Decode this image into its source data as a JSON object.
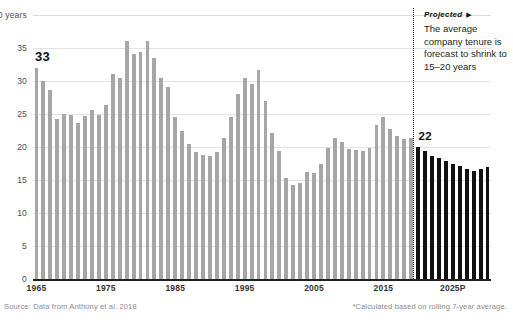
{
  "chart_data": {
    "type": "bar",
    "title": "",
    "xlabel": "",
    "ylabel": "years",
    "ylim": [
      0,
      40
    ],
    "ytick_values": [
      0,
      5,
      10,
      15,
      20,
      25,
      30,
      35,
      40
    ],
    "ytick_labels": [
      "0",
      "5",
      "10",
      "15",
      "20",
      "25",
      "30",
      "35",
      "40 years"
    ],
    "xtick_labels": [
      "1965",
      "1975",
      "1985",
      "1995",
      "2005",
      "2015",
      "2025P"
    ],
    "xtick_years": [
      1965,
      1975,
      1985,
      1995,
      2005,
      2015,
      2025
    ],
    "grid": true,
    "legend": "none",
    "x_start_year": 1965,
    "x_end_year": 2030,
    "projection_start_year": 2020,
    "bar_color": "#a6a6a6",
    "projected_bar_color": "#111111",
    "series": [
      {
        "name": "Average company tenure (historical)",
        "kind": "historical",
        "color": "#a6a6a6",
        "x": [
          1965,
          1966,
          1967,
          1968,
          1969,
          1970,
          1971,
          1972,
          1973,
          1974,
          1975,
          1976,
          1977,
          1978,
          1979,
          1980,
          1981,
          1982,
          1983,
          1984,
          1985,
          1986,
          1987,
          1988,
          1989,
          1990,
          1991,
          1992,
          1993,
          1994,
          1995,
          1996,
          1997,
          1998,
          1999,
          2000,
          2001,
          2002,
          2003,
          2004,
          2005,
          2006,
          2007,
          2008,
          2009,
          2010,
          2011,
          2012,
          2013,
          2014,
          2015,
          2016,
          2017,
          2018,
          2019
        ],
        "values": [
          32.0,
          30.0,
          28.6,
          24.2,
          25.0,
          24.8,
          23.7,
          24.7,
          25.6,
          24.9,
          26.4,
          31.0,
          30.5,
          36.0,
          34.1,
          34.4,
          36.0,
          33.5,
          30.5,
          29.1,
          24.5,
          22.4,
          20.5,
          19.3,
          18.8,
          18.7,
          19.3,
          21.4,
          24.6,
          28.0,
          30.5,
          29.6,
          31.6,
          26.9,
          22.1,
          19.4,
          15.3,
          14.2,
          14.6,
          16.2,
          16.0,
          17.5,
          19.9,
          21.4,
          20.8,
          19.7,
          19.5,
          19.4,
          19.9,
          23.4,
          24.6,
          22.7,
          21.6,
          21.2,
          21.3
        ]
      },
      {
        "name": "Average company tenure (projected)",
        "kind": "projected",
        "color": "#111111",
        "x": [
          2020,
          2021,
          2022,
          2023,
          2024,
          2025,
          2026,
          2027,
          2028,
          2029,
          2030
        ],
        "values": [
          20.0,
          19.4,
          18.7,
          18.4,
          17.9,
          17.5,
          17.1,
          16.6,
          16.4,
          16.6,
          17.0
        ]
      }
    ],
    "annotations": [
      {
        "name": "first-value-label",
        "text": "33",
        "year": 1965
      },
      {
        "name": "projection-value-label",
        "text": "22",
        "year": 2020
      }
    ]
  },
  "callouts": {
    "value_33": "33",
    "value_22": "22"
  },
  "annotation": {
    "heading": "Projected",
    "heading_marker": "▶",
    "body": "The average company tenure is forecast to shrink to 15–20 years"
  },
  "footnotes": {
    "source": "Source: Data from Anthony et al. 2018",
    "method": "*Calculated based on rolling 7-year average."
  }
}
